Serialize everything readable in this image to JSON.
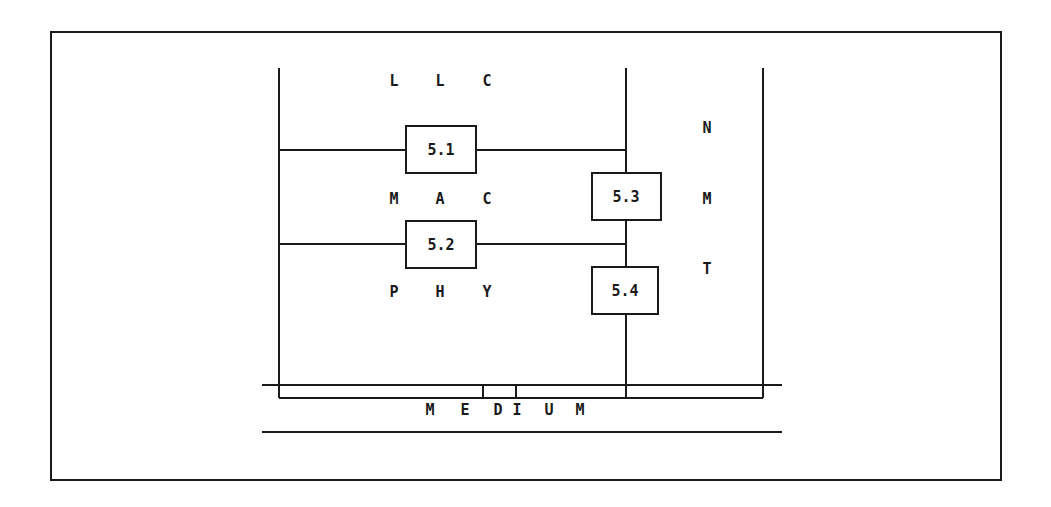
{
  "diagram": {
    "layers": {
      "llc": [
        "L",
        "L",
        "C"
      ],
      "mac": [
        "M",
        "A",
        "C"
      ],
      "phy": [
        "P",
        "H",
        "Y"
      ]
    },
    "management": [
      "N",
      "M",
      "T"
    ],
    "boxes": {
      "b51": "5.1",
      "b52": "5.2",
      "b53": "5.3",
      "b54": "5.4"
    },
    "medium": [
      "M",
      "E",
      "D",
      "I",
      "U",
      "M"
    ],
    "colors": {
      "line": "#1a1a1a",
      "background": "#ffffff"
    }
  }
}
